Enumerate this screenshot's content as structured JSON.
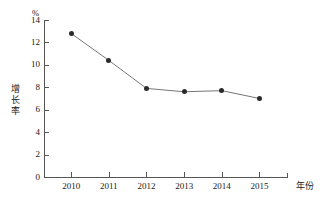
{
  "chart_data": {
    "type": "line",
    "title": "",
    "xlabel": "年份",
    "ylabel": "增长率",
    "yunit": "%",
    "categories": [
      "2010",
      "2011",
      "2012",
      "2013",
      "2014",
      "2015"
    ],
    "values": [
      12.8,
      10.4,
      7.9,
      7.6,
      7.7,
      7.0
    ],
    "series": [
      {
        "name": "增长率",
        "values": [
          12.8,
          10.4,
          7.9,
          7.6,
          7.7,
          7.0
        ]
      }
    ],
    "ylim": [
      0,
      14
    ],
    "yticks": [
      0,
      2,
      4,
      6,
      8,
      10,
      12,
      14
    ],
    "ytick_labels": [
      "0",
      "2",
      "4",
      "6",
      "8",
      "10",
      "12",
      "14"
    ],
    "xtick_labels": [
      "2010",
      "2011",
      "2012",
      "2013",
      "2014",
      "2015"
    ],
    "grid": false,
    "legend": "none",
    "marker": "circle",
    "line_color": "#777777",
    "marker_color": "#2a2a2a",
    "axis_color": "#555555",
    "background_color": "#ffffff"
  }
}
